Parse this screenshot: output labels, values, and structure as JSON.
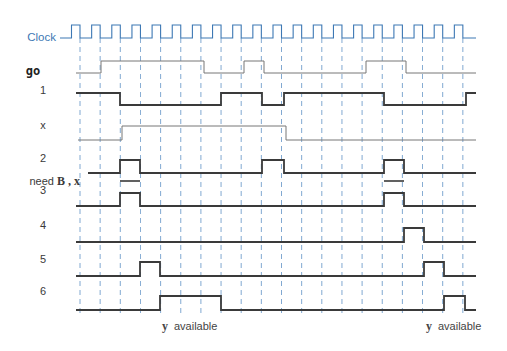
{
  "diagram": {
    "title_fragment": "a.",
    "clock": {
      "label": "Clock",
      "color": "#3d78b4",
      "start_x": 60,
      "first_rise_x": 71.5,
      "period": 20.15,
      "high_width": 8.5,
      "cycles": 20,
      "end_x": 476,
      "y_high": 25,
      "y_low": 38
    },
    "grid": {
      "dashed_lines_x_start": 80,
      "dashed_lines_spacing": 20.15,
      "dashed_lines_count": 20,
      "y_top": 38,
      "y_bottom": 316,
      "color": "#5b8fc4"
    },
    "signals": [
      {
        "id": "go",
        "label": "go",
        "label_style": "bold-mono",
        "label_y": 73,
        "y_high": 61,
        "y_low": 73,
        "start_x": 76,
        "end_x": 476,
        "color": "#777777",
        "width": 1,
        "init": 0,
        "edges": [
          101,
          204,
          244,
          264,
          366,
          406
        ]
      },
      {
        "id": "s1",
        "label": "1",
        "label_y": 93,
        "y_high": 93,
        "y_low": 105,
        "start_x": 76,
        "end_x": 476,
        "color": "#3a3a3a",
        "width": 1.8,
        "init": 1,
        "edges": [
          120,
          221,
          262,
          284,
          384,
          466
        ]
      },
      {
        "id": "x",
        "label": "x",
        "label_y": 128,
        "y_high": 126,
        "y_low": 140,
        "start_x": 78,
        "end_x": 476,
        "color": "#777777",
        "width": 1,
        "init": 0,
        "edges": [
          122,
          286
        ]
      },
      {
        "id": "s2",
        "label": "2",
        "label_y": 161,
        "y_high": 160,
        "y_low": 173,
        "start_x": 88,
        "end_x": 476,
        "color": "#3a3a3a",
        "width": 1.8,
        "init": 0,
        "edges": [
          120,
          140,
          262,
          284,
          384,
          404
        ]
      },
      {
        "id": "s3",
        "label": "3",
        "label_y": 193,
        "y_high": 193,
        "y_low": 206,
        "start_x": 76,
        "end_x": 476,
        "color": "#3a3a3a",
        "width": 1.8,
        "init": 0,
        "edges": [
          120,
          140,
          384,
          404
        ]
      },
      {
        "id": "s4",
        "label": "4",
        "label_y": 228,
        "y_high": 228,
        "y_low": 242,
        "start_x": 76,
        "end_x": 476,
        "color": "#3a3a3a",
        "width": 1.8,
        "init": 0,
        "edges": [
          404,
          424
        ]
      },
      {
        "id": "s5",
        "label": "5",
        "label_y": 262,
        "y_high": 262,
        "y_low": 276,
        "start_x": 76,
        "end_x": 476,
        "color": "#3a3a3a",
        "width": 1.8,
        "init": 0,
        "edges": [
          140,
          160,
          424,
          444
        ]
      },
      {
        "id": "s6",
        "label": "6",
        "label_y": 294,
        "y_high": 296,
        "y_low": 310,
        "start_x": 76,
        "end_x": 476,
        "color": "#3a3a3a",
        "width": 1.8,
        "init": 0,
        "edges": [
          160,
          221,
          444,
          465
        ]
      }
    ],
    "need_bars": {
      "label_prefix": "need",
      "label_vars": "B , x",
      "y": 181,
      "segments": [
        [
          120,
          140
        ],
        [
          384,
          404
        ]
      ]
    },
    "annotations": [
      {
        "var": "y",
        "text": "available",
        "x": 162,
        "y": 327
      },
      {
        "var": "y",
        "text": "available",
        "x": 426,
        "y": 327
      }
    ]
  }
}
